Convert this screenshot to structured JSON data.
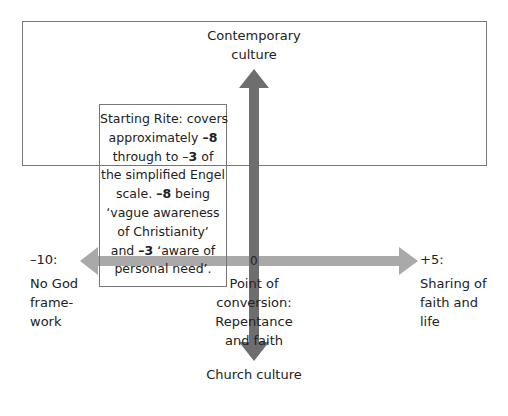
{
  "diagram": {
    "type": "axes-cross",
    "colors": {
      "vertical_arrow": "#6e6e6e",
      "horizontal_arrow": "#a9a9a9",
      "frame": "#777777",
      "text": "#222222"
    },
    "top_label": [
      "Contemporary",
      "culture"
    ],
    "bottom_label": "Church culture",
    "origin_label": "0",
    "left": {
      "value": "–10:",
      "desc": [
        "No God",
        "frame-",
        "work"
      ]
    },
    "right": {
      "value": "+5:",
      "desc": [
        "Sharing of",
        "faith and",
        "life"
      ]
    },
    "center_below": [
      "Point of",
      "conversion:",
      "Repentance",
      "and faith"
    ],
    "note": {
      "lines": [
        [
          {
            "t": "Starting Rite: covers",
            "b": false
          }
        ],
        [
          {
            "t": "approximately ",
            "b": false
          },
          {
            "t": "–8",
            "b": true
          }
        ],
        [
          {
            "t": "through to –",
            "b": false
          },
          {
            "t": "3",
            "b": true
          },
          {
            "t": " of",
            "b": false
          }
        ],
        [
          {
            "t": "the simplified Engel",
            "b": false
          }
        ],
        [
          {
            "t": "scale. ",
            "b": false
          },
          {
            "t": "–8",
            "b": true
          },
          {
            "t": " being",
            "b": false
          }
        ],
        [
          {
            "t": "‘vague awareness",
            "b": false
          }
        ],
        [
          {
            "t": "of Christianity’",
            "b": false
          }
        ],
        [
          {
            "t": "and ",
            "b": false
          },
          {
            "t": "–3",
            "b": true
          },
          {
            "t": " ‘aware of",
            "b": false
          }
        ],
        [
          {
            "t": "personal need’.",
            "b": false
          }
        ]
      ]
    }
  }
}
